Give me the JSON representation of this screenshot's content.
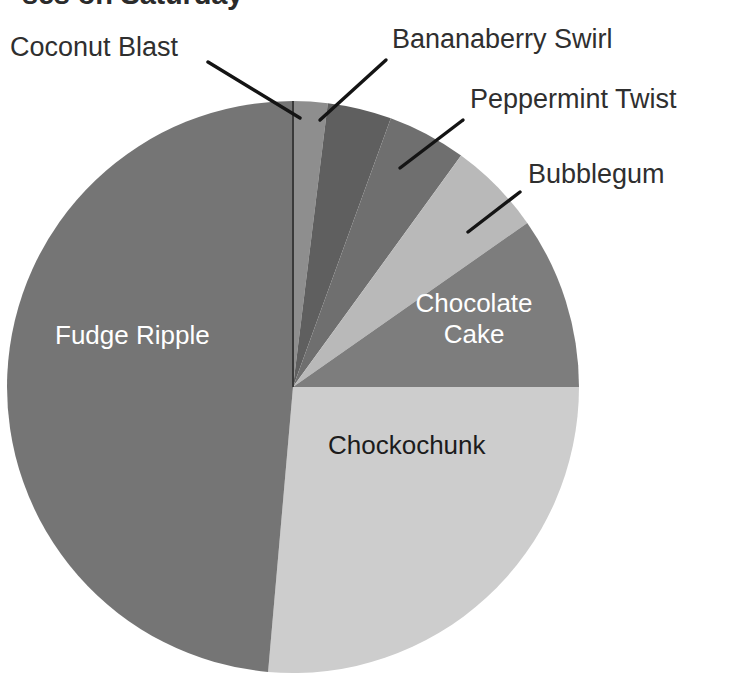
{
  "chart_data": {
    "type": "pie",
    "title_visible_fragment": "ses on Saturday",
    "subtitle": "",
    "xlabel": "",
    "ylabel": "",
    "legend_position": "none",
    "labels_position": "callout-and-inside",
    "grid": false,
    "start_angle_deg": 0,
    "direction": "clockwise",
    "center": {
      "x": 293,
      "y": 387
    },
    "radius": 286,
    "categories": [
      "Coconut Blast",
      "Bananaberry Swirl",
      "Peppermint Twist",
      "Bubblegum",
      "Chocolate Cake",
      "Chockochunk",
      "Fudge Ripple"
    ],
    "values": [
      2,
      3.6,
      4.4,
      5.3,
      9.7,
      26.4,
      48.6
    ],
    "angles_deg": [
      7,
      13,
      16,
      19,
      35,
      95,
      175
    ],
    "colors": [
      "#8e8e8e",
      "#5f5f5f",
      "#6f6f6f",
      "#b9b9b9",
      "#7d7d7d",
      "#cdcdcd",
      "#757575"
    ],
    "slices": [
      {
        "label": "Coconut Blast",
        "value": 2,
        "angle_deg": 7,
        "color": "#8e8e8e",
        "label_style": "callout",
        "label_color": "#2f2f2f"
      },
      {
        "label": "Bananaberry Swirl",
        "value": 3.6,
        "angle_deg": 13,
        "color": "#5f5f5f",
        "label_style": "callout",
        "label_color": "#2f2f2f"
      },
      {
        "label": "Peppermint Twist",
        "value": 4.4,
        "angle_deg": 16,
        "color": "#6f6f6f",
        "label_style": "callout",
        "label_color": "#2f2f2f"
      },
      {
        "label": "Bubblegum",
        "value": 5.3,
        "angle_deg": 19,
        "color": "#b9b9b9",
        "label_style": "callout",
        "label_color": "#2f2f2f"
      },
      {
        "label": "Chocolate Cake",
        "value": 9.7,
        "angle_deg": 35,
        "color": "#7d7d7d",
        "label_style": "inside",
        "label_color": "#ffffff"
      },
      {
        "label": "Chockochunk",
        "value": 26.4,
        "angle_deg": 95,
        "color": "#cdcdcd",
        "label_style": "inside",
        "label_color": "#1c1c1c"
      },
      {
        "label": "Fudge Ripple",
        "value": 48.6,
        "angle_deg": 175,
        "color": "#757575",
        "label_style": "inside",
        "label_color": "#ffffff"
      }
    ]
  },
  "labels": {
    "coconut_blast": "Coconut Blast",
    "bananaberry_swirl": "Bananaberry Swirl",
    "peppermint_twist": "Peppermint Twist",
    "bubblegum": "Bubblegum",
    "chocolate_cake_line1": "Chocolate",
    "chocolate_cake_line2": "Cake",
    "chockochunk": "Chockochunk",
    "fudge_ripple": "Fudge Ripple"
  },
  "title": {
    "text": "ses on Saturday"
  },
  "colors": {
    "background": "#ffffff",
    "text_dark": "#2f2f2f",
    "text_light": "#ffffff",
    "leader_line": "#141414",
    "slice_divider": "#3a3a3a"
  }
}
